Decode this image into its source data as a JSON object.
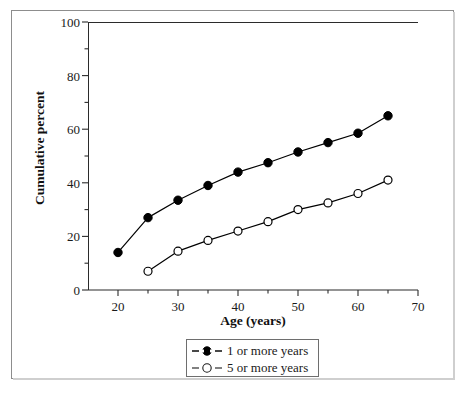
{
  "chart_data": {
    "type": "line",
    "title": "",
    "xlabel": "Age (years)",
    "ylabel": "Cumulative percent",
    "xlim": [
      15,
      70
    ],
    "ylim": [
      0,
      100
    ],
    "grid": false,
    "legend_position": "bottom-center",
    "x_major_ticks": [
      20,
      30,
      40,
      50,
      60,
      70
    ],
    "x_minor_ticks": [
      25,
      35,
      45,
      55,
      65
    ],
    "x_tick_labels": [
      "20",
      "30",
      "40",
      "50",
      "60",
      "70"
    ],
    "y_major_ticks": [
      0,
      20,
      40,
      60,
      80,
      100
    ],
    "y_minor_ticks": [
      10,
      30,
      50,
      70,
      90
    ],
    "y_tick_labels": [
      "0",
      "20",
      "40",
      "60",
      "80",
      "100"
    ],
    "series": [
      {
        "name": "1 or more years",
        "marker": "filled-circle",
        "color": "#000000",
        "x": [
          20,
          25,
          30,
          35,
          40,
          45,
          50,
          55,
          60,
          65
        ],
        "values": [
          14,
          27,
          33.5,
          39,
          44,
          47.5,
          51.5,
          55,
          58.5,
          65
        ]
      },
      {
        "name": "5 or more years",
        "marker": "open-circle",
        "color": "#000000",
        "x": [
          25,
          30,
          35,
          40,
          45,
          50,
          55,
          60,
          65
        ],
        "values": [
          7,
          14.5,
          18.5,
          22,
          25.5,
          30,
          32.5,
          36,
          41
        ]
      }
    ]
  },
  "legend": {
    "entries": [
      {
        "label": "1 or more years",
        "marker": "filled-circle"
      },
      {
        "label": "5 or more years",
        "marker": "open-circle"
      }
    ]
  },
  "colors": {
    "plot_line": "#1a1a1a",
    "axis": "#2b2b2b",
    "frame": "#8d8d8d",
    "background": "#ffffff"
  }
}
